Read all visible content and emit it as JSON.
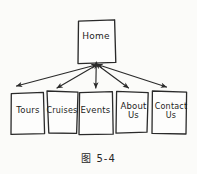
{
  "figure": {
    "kind": "hand-drawn-sitemap-diagram",
    "caption": "图 5-4",
    "ink_color": "#262626",
    "paper_color": "#fbfbf9"
  },
  "nodes": {
    "root": {
      "id": "home",
      "label": "Home"
    },
    "children": [
      {
        "id": "tours",
        "label": "Tours"
      },
      {
        "id": "cruises",
        "label": "Cruises"
      },
      {
        "id": "events",
        "label": "Events"
      },
      {
        "id": "about",
        "label": "About\nUs"
      },
      {
        "id": "contact",
        "label": "Contact\nUs"
      }
    ]
  },
  "connectors": {
    "style": "double-headed-arrow",
    "from": "home",
    "to": [
      "tours",
      "cruises",
      "events",
      "about",
      "contact"
    ]
  }
}
